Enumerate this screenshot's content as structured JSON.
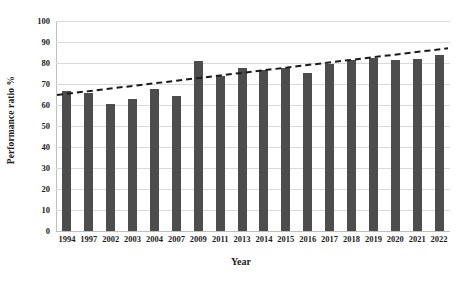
{
  "chart_data": {
    "type": "bar",
    "title": "",
    "xlabel": "Year",
    "ylabel": "Performance ratio %",
    "categories": [
      "1994",
      "1997",
      "2002",
      "2003",
      "2004",
      "2007",
      "2009",
      "2011",
      "2013",
      "2014",
      "2015",
      "2016",
      "2017",
      "2018",
      "2019",
      "2020",
      "2021",
      "2022"
    ],
    "values": [
      66.7,
      65.7,
      60.5,
      62.9,
      67.6,
      64.3,
      81.0,
      73.8,
      77.6,
      76.7,
      77.6,
      75.2,
      79.5,
      81.4,
      82.4,
      81.4,
      81.9,
      83.8
    ],
    "series": [
      {
        "name": "Performance ratio %",
        "type": "bar",
        "color": "#4d4d4d",
        "values": [
          66.7,
          65.7,
          60.5,
          62.9,
          67.6,
          64.3,
          81.0,
          73.8,
          77.6,
          76.7,
          77.6,
          75.2,
          79.5,
          81.4,
          82.4,
          81.4,
          81.9,
          83.8
        ]
      },
      {
        "name": "Linear trendline",
        "type": "line",
        "style": "dashed",
        "color": "#1a1a1a",
        "endpoints": [
          64.8,
          87.0
        ]
      }
    ],
    "ylim": [
      0,
      100
    ],
    "ytick_step": 10,
    "yticks": [
      "100",
      "90",
      "80",
      "70",
      "60",
      "50",
      "40",
      "30",
      "20",
      "10",
      "0"
    ],
    "grid": true,
    "legend": "none"
  },
  "axes": {
    "y_title": "Performance ratio %",
    "x_title": "Year"
  },
  "colors": {
    "bar": "#4d4d4d",
    "trendline": "#1a1a1a",
    "gridline": "#d9d9d9",
    "axis": "#bfbfbf",
    "background": "#ffffff",
    "text": "#1c1c1c"
  }
}
